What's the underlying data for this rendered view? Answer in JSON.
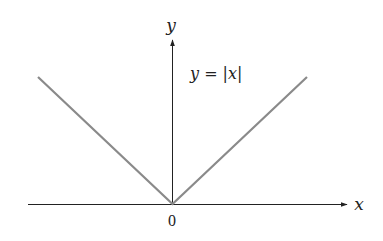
{
  "figure": {
    "type": "function-graph",
    "function_label": "y = |x|",
    "axes": {
      "x_label": "x",
      "y_label": "y",
      "origin_label": "0"
    },
    "colors": {
      "axis": "#222222",
      "curve": "#8a8a8a",
      "background": "#ffffff"
    }
  }
}
